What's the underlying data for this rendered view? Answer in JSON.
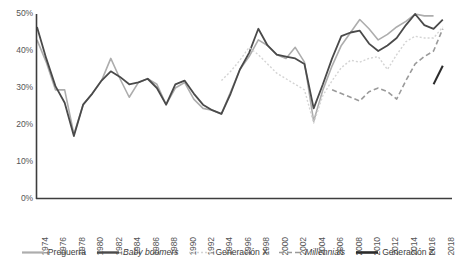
{
  "chart_data": {
    "type": "line",
    "title": "",
    "subtitle": "",
    "xlabel": "",
    "ylabel": "",
    "xlim": [
      1974,
      2019
    ],
    "ylim": [
      0,
      0.5
    ],
    "grid": false,
    "legend_position": "bottom",
    "y_ticks": [
      "0%",
      "10%",
      "20%",
      "30%",
      "40%",
      "50%"
    ],
    "y_tick_values": [
      0,
      10,
      20,
      30,
      40,
      50
    ],
    "x_ticks": [
      "1974",
      "1976",
      "1978",
      "1980",
      "1982",
      "1984",
      "1986",
      "1988",
      "1990",
      "1992",
      "1994",
      "1996",
      "1998",
      "2000",
      "2002",
      "2004",
      "2006",
      "2008",
      "2010",
      "2012",
      "2014",
      "2016",
      "2018"
    ],
    "x_tick_values": [
      1974,
      1976,
      1978,
      1980,
      1982,
      1984,
      1986,
      1988,
      1990,
      1992,
      1994,
      1996,
      1998,
      2000,
      2002,
      2004,
      2006,
      2008,
      2010,
      2012,
      2014,
      2016,
      2018
    ],
    "series": [
      {
        "name": "Preguerra",
        "color": "#adadad",
        "dash": "none",
        "width": 1.6,
        "italic": false,
        "x": [
          1974,
          1975,
          1976,
          1977,
          1978,
          1979,
          1980,
          1981,
          1982,
          1983,
          1984,
          1985,
          1986,
          1987,
          1988,
          1989,
          1990,
          1991,
          1992,
          1993,
          1994,
          1995,
          1996,
          1997,
          1998,
          1999,
          2000,
          2001,
          2002,
          2003,
          2004,
          2005,
          2006,
          2007,
          2008,
          2009,
          2010,
          2011,
          2012,
          2013,
          2014,
          2015,
          2016,
          2017
        ],
        "values": [
          43.0,
          37.0,
          29.5,
          29.5,
          17.5,
          25.5,
          28.5,
          32.0,
          38.0,
          32.5,
          27.5,
          31.5,
          32.5,
          31.0,
          25.5,
          30.0,
          31.5,
          27.0,
          24.5,
          24.0,
          23.0,
          29.0,
          35.0,
          38.5,
          43.0,
          41.5,
          39.0,
          38.0,
          41.0,
          37.0,
          21.0,
          29.5,
          36.0,
          41.5,
          45.0,
          48.5,
          46.0,
          43.0,
          44.5,
          46.5,
          48.0,
          50.0,
          49.5,
          49.5
        ]
      },
      {
        "name": "Baby boomers",
        "color": "#4a4a4a",
        "dash": "none",
        "width": 1.8,
        "italic": true,
        "x": [
          1974,
          1975,
          1976,
          1977,
          1978,
          1979,
          1980,
          1981,
          1982,
          1983,
          1984,
          1985,
          1986,
          1987,
          1988,
          1989,
          1990,
          1991,
          1992,
          1993,
          1994,
          1995,
          1996,
          1997,
          1998,
          1999,
          2000,
          2001,
          2002,
          2003,
          2004,
          2005,
          2006,
          2007,
          2008,
          2009,
          2010,
          2011,
          2012,
          2013,
          2014,
          2015,
          2016,
          2017,
          2018
        ],
        "values": [
          46.5,
          38.0,
          30.5,
          26.0,
          17.0,
          25.5,
          28.5,
          32.0,
          34.5,
          33.0,
          31.0,
          31.5,
          32.5,
          30.0,
          25.5,
          31.0,
          32.0,
          28.5,
          25.5,
          24.0,
          23.0,
          28.5,
          35.0,
          39.5,
          46.0,
          41.5,
          39.0,
          38.5,
          38.0,
          36.5,
          24.5,
          31.0,
          38.0,
          44.0,
          45.0,
          45.5,
          42.0,
          40.0,
          41.5,
          43.5,
          47.0,
          50.0,
          47.0,
          46.0,
          48.5
        ]
      },
      {
        "name": "Generación X",
        "color": "#d4d4d4",
        "dash": "2 2",
        "width": 1.4,
        "italic": false,
        "x": [
          1994,
          1995,
          1996,
          1997,
          1998,
          1999,
          2000,
          2001,
          2002,
          2003,
          2004,
          2005,
          2006,
          2007,
          2008,
          2009,
          2010,
          2011,
          2012,
          2013,
          2014,
          2015,
          2016,
          2017,
          2018
        ],
        "values": [
          32.0,
          34.5,
          37.5,
          41.0,
          39.0,
          36.5,
          34.0,
          32.5,
          31.0,
          29.5,
          20.5,
          28.0,
          32.0,
          35.5,
          37.5,
          37.0,
          38.0,
          38.5,
          35.0,
          39.0,
          42.5,
          44.0,
          43.5,
          43.5,
          46.5
        ]
      },
      {
        "name": "Millennials",
        "color": "#9a9a9a",
        "dash": "5 3",
        "width": 1.6,
        "italic": true,
        "x": [
          2006,
          2007,
          2008,
          2009,
          2010,
          2011,
          2012,
          2013,
          2014,
          2015,
          2016,
          2017,
          2018
        ],
        "values": [
          29.5,
          28.5,
          27.5,
          26.5,
          29.0,
          30.0,
          29.0,
          27.0,
          32.0,
          36.5,
          38.5,
          40.0,
          46.0
        ]
      },
      {
        "name": "Generación Z",
        "color": "#2b2b2b",
        "dash": "none",
        "width": 2.0,
        "italic": false,
        "x": [
          2017,
          2018
        ],
        "values": [
          31.0,
          36.0
        ]
      }
    ]
  },
  "legend": {
    "items": [
      {
        "label": "Preguerra"
      },
      {
        "label": "Baby boomers"
      },
      {
        "label": "Generación X"
      },
      {
        "label": "Millennials"
      },
      {
        "label": "Generación Z"
      }
    ]
  },
  "axes": {
    "axis_color": "#3d3d3d"
  }
}
